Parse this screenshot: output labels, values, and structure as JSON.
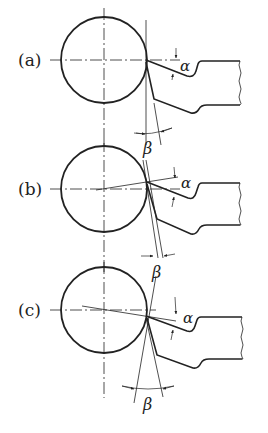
{
  "diagram": {
    "type": "cutting-tool-geometry",
    "panels": [
      {
        "label": "(a)",
        "alpha_label": "α",
        "beta_label": "β"
      },
      {
        "label": "(b)",
        "alpha_label": "α",
        "beta_label": "β"
      },
      {
        "label": "(c)",
        "alpha_label": "α",
        "beta_label": "β"
      }
    ],
    "colors": {
      "line": "#222222",
      "background": "#ffffff"
    }
  }
}
